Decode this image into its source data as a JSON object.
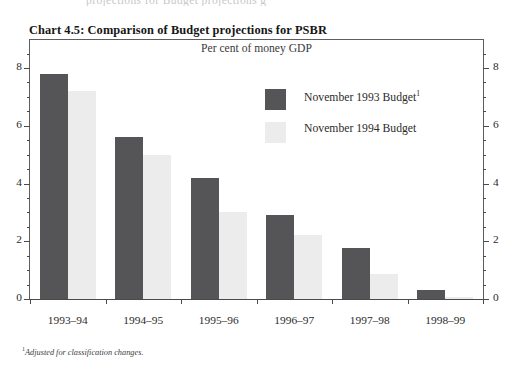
{
  "page": {
    "clipped_text_above": "projections for Budget projections g",
    "footnote_marker": "1",
    "footnote_text": "Adjusted for classification changes."
  },
  "chart_data": {
    "type": "bar",
    "title": "Chart 4.5: Comparison of Budget projections for PSBR",
    "subtitle": "Per cent of money GDP",
    "xlabel": "",
    "ylabel": "",
    "ylim": [
      0,
      8.6
    ],
    "yticks": [
      0,
      2,
      4,
      6,
      8
    ],
    "ytick_labels": [
      "0",
      "2",
      "4",
      "6",
      "8"
    ],
    "yminor_step": 0.5,
    "grid": false,
    "axis_both_sides": true,
    "legend_position": "upper-right-inside",
    "categories": [
      "1993–94",
      "1994–95",
      "1995–96",
      "1996–97",
      "1997–98",
      "1998–99"
    ],
    "series": [
      {
        "name": "November 1993 Budget",
        "name_superscript": "1",
        "color": "#555558",
        "values": [
          7.8,
          5.6,
          4.2,
          2.9,
          1.75,
          0.3
        ]
      },
      {
        "name": "November 1994 Budget",
        "name_superscript": "",
        "color": "#ececec",
        "values": [
          7.2,
          5.0,
          3.0,
          2.2,
          0.85,
          0.07
        ]
      }
    ]
  }
}
